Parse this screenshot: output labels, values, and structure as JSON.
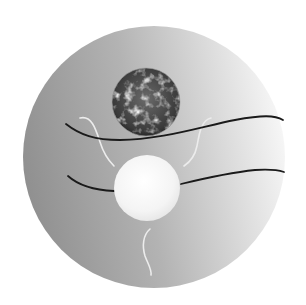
{
  "figure": {
    "title": "Earth and Sun with field lines on a shaded disc",
    "background": "#ffffff",
    "disc": {
      "cx": 154,
      "cy": 157,
      "r": 131,
      "color_dark": "#8f8f8f",
      "color_light": "#f7f7f7"
    },
    "earth": {
      "cx": 146,
      "cy": 102,
      "r": 34,
      "color_dark": "#1e1e1e",
      "color_mid": "#6a6a6a",
      "color_light": "#d8d8d8"
    },
    "sun": {
      "cx": 147,
      "cy": 188,
      "r": 33,
      "color_center": "#ffffff",
      "color_edge": "#e4e4e4"
    },
    "dark_lines": [
      {
        "name": "upper-field-line",
        "d": "M66,124 C80,135 95,140 120,140 C160,140 200,127 235,120 C262,115 275,115 283,120",
        "color": "#1a1a1a"
      },
      {
        "name": "lower-field-line",
        "d": "M68,176 C78,185 92,190 114,191 M181,184 C210,177 235,172 255,170 C270,169 278,170 284,172",
        "color": "#1a1a1a"
      }
    ],
    "light_lines": [
      {
        "name": "left-wavy-line",
        "d": "M80,118 C92,115 96,130 100,142 C104,155 110,162 114,166",
        "color": "#ececec"
      },
      {
        "name": "right-wavy-line",
        "d": "M211,118 C201,120 199,135 197,146 C195,156 190,162 184,166",
        "color": "#ececec"
      },
      {
        "name": "bottom-wavy-line",
        "d": "M150,229 C143,235 142,246 145,256 C148,264 152,270 151,275",
        "color": "#ececec"
      }
    ]
  }
}
